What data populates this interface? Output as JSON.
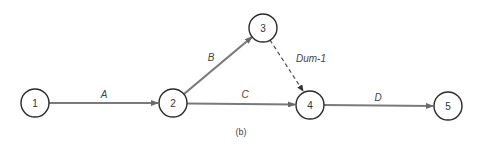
{
  "diagram": {
    "type": "activity-on-arrow network",
    "caption": "(b)",
    "nodes": [
      {
        "id": "1",
        "label": "1",
        "x": 35,
        "y": 103
      },
      {
        "id": "2",
        "label": "2",
        "x": 173,
        "y": 103
      },
      {
        "id": "3",
        "label": "3",
        "x": 263,
        "y": 28
      },
      {
        "id": "4",
        "label": "4",
        "x": 310,
        "y": 105
      },
      {
        "id": "5",
        "label": "5",
        "x": 448,
        "y": 106
      }
    ],
    "edges": [
      {
        "from": "1",
        "to": "2",
        "label": "A",
        "style": "solid"
      },
      {
        "from": "2",
        "to": "3",
        "label": "B",
        "style": "solid"
      },
      {
        "from": "2",
        "to": "4",
        "label": "C",
        "style": "solid"
      },
      {
        "from": "3",
        "to": "4",
        "label": "Dum-1",
        "style": "dashed"
      },
      {
        "from": "4",
        "to": "5",
        "label": "D",
        "style": "solid"
      }
    ]
  }
}
